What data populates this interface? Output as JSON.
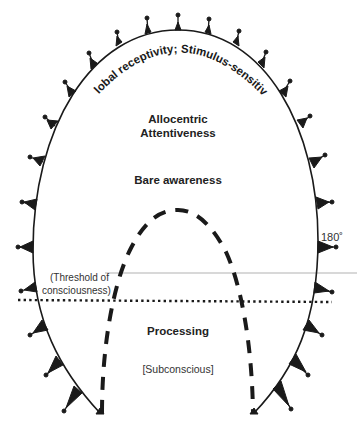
{
  "diagram": {
    "arc_label": "Global receptivity; Stimulus-sensitive",
    "labels": {
      "allocentric_line1": "Allocentric",
      "allocentric_line2": "Attentiveness",
      "bare_awareness": "Bare awareness",
      "angle": "180˚",
      "threshold_line1": "(Threshold of",
      "threshold_line2": "consciousness)",
      "processing": "Processing",
      "subconscious": "[Subconscious]"
    },
    "colors": {
      "ink": "#1a1a1a",
      "background": "#ffffff",
      "faint_line": "#d8d8d8"
    },
    "elements": {
      "outer_boundary": "solid curved arc with outward pin ticks",
      "inner_boundary": "dashed parabola",
      "threshold_line": "dotted horizontal line"
    }
  }
}
